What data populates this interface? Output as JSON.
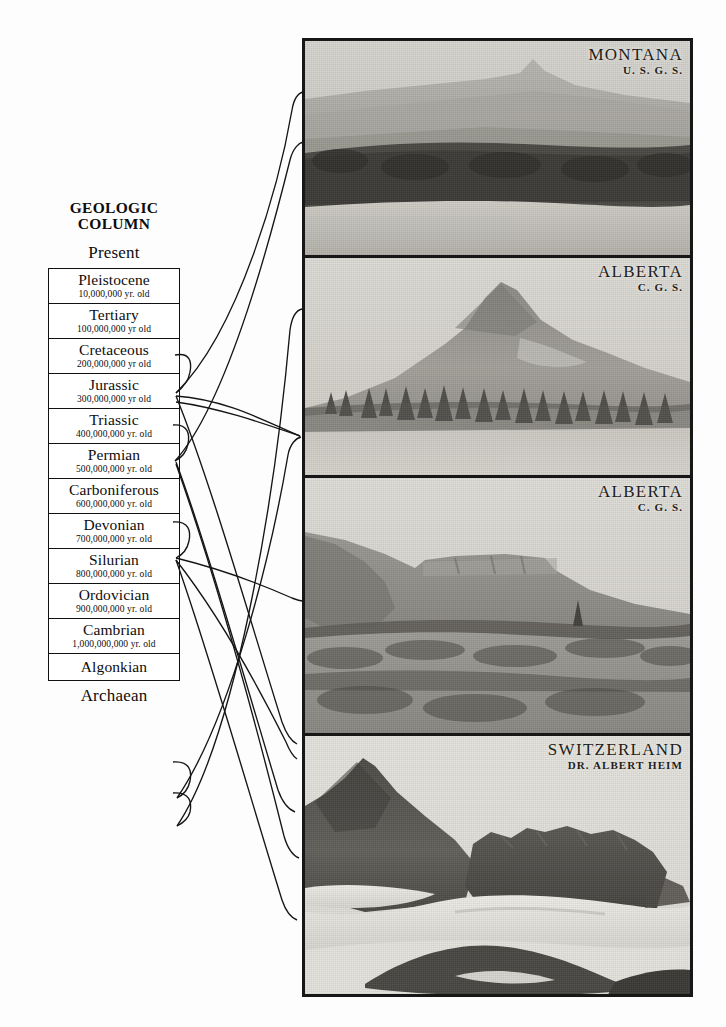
{
  "figure": {
    "title_line_1": "GEOLOGIC",
    "title_line_2": "COLUMN",
    "top_label": "Present",
    "bottom_label": "Archaean"
  },
  "column": {
    "strata": [
      {
        "era": "Pleistocene",
        "age": "10,000,000 yr. old"
      },
      {
        "era": "Tertiary",
        "age": "100,000,000 yr  old"
      },
      {
        "era": "Cretaceous",
        "age": "200,000,000 yr  old"
      },
      {
        "era": "Jurassic",
        "age": "300,000,000 yr  old"
      },
      {
        "era": "Triassic",
        "age": "400,000,000 yr. old"
      },
      {
        "era": "Permian",
        "age": "500,000,000 yr. old"
      },
      {
        "era": "Carboniferous",
        "age": "600,000,000 yr. old"
      },
      {
        "era": "Devonian",
        "age": "700,000,000 yr. old"
      },
      {
        "era": "Silurian",
        "age": "800,000,000 yr. old"
      },
      {
        "era": "Ordovician",
        "age": "900,000,000 yr. old"
      },
      {
        "era": "Cambrian",
        "age": "1,000,000,000 yr. old"
      },
      {
        "era": "Algonkian",
        "age": ""
      }
    ]
  },
  "photos": [
    {
      "place": "MONTANA",
      "credit": "U. S. G. S.",
      "subject": "hazy-mountain-skyline-over-lake"
    },
    {
      "place": "ALBERTA",
      "credit": "C. G. S.",
      "subject": "conical-peak-with-evergreens"
    },
    {
      "place": "ALBERTA",
      "credit": "C. G. S.",
      "subject": "flat-topped-escarpment-with-brush"
    },
    {
      "place": "SWITZERLAND",
      "credit": "DR. ALBERT HEIM",
      "subject": "jagged-rock-peaks-with-snowfields"
    }
  ],
  "colors": {
    "ink": "#151515",
    "frame": "#171717",
    "paper": "#fdfdfd"
  }
}
